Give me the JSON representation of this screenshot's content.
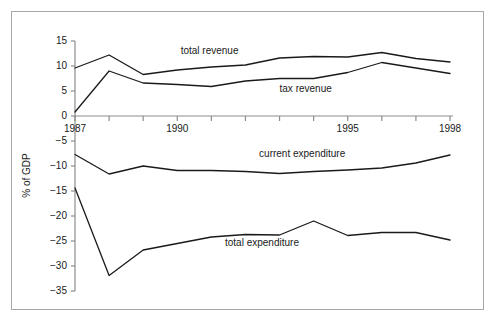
{
  "chart_data": {
    "type": "line",
    "title": "",
    "subtitle": "",
    "xlabel": "",
    "ylabel": "% of GDP",
    "x": [
      1987,
      1988,
      1989,
      1990,
      1991,
      1992,
      1993,
      1994,
      1995,
      1996,
      1997,
      1998
    ],
    "xlim": [
      1986.8,
      1998.2
    ],
    "ylim": [
      -35,
      15
    ],
    "xticks": [
      1987,
      1988,
      1989,
      1990,
      1991,
      1992,
      1993,
      1994,
      1995,
      1996,
      1997,
      1998
    ],
    "xtick_labels": [
      "1987",
      "",
      "",
      "1990",
      "",
      "",
      "",
      "",
      "1995",
      "",
      "",
      "1998"
    ],
    "yticks": [
      15,
      10,
      5,
      0,
      -5,
      -10,
      -15,
      -20,
      -25,
      -30,
      -35
    ],
    "ytick_labels": [
      "15",
      "10",
      "5",
      "0",
      "-5",
      "-10",
      "-15",
      "-20",
      "-25",
      "-30",
      "-35"
    ],
    "grid": false,
    "legend_position": "inline-annotations",
    "zero_line": true,
    "line_color": "#1a1a1a",
    "series": [
      {
        "name": "total revenue",
        "label": "total revenue",
        "values": [
          9.6,
          12.2,
          8.3,
          9.2,
          9.8,
          10.2,
          11.6,
          11.9,
          11.8,
          12.7,
          11.5,
          10.8
        ]
      },
      {
        "name": "tax revenue",
        "label": "tax revenue",
        "values": [
          0.8,
          9.0,
          6.6,
          6.3,
          5.9,
          7.0,
          7.5,
          7.5,
          8.7,
          10.7,
          9.6,
          8.5
        ]
      },
      {
        "name": "current expenditure",
        "label": "current expenditure",
        "values": [
          -7.7,
          -11.6,
          -10.0,
          -10.9,
          -10.9,
          -11.1,
          -11.5,
          -11.1,
          -10.8,
          -10.4,
          -9.4,
          -7.8
        ]
      },
      {
        "name": "total expenditure",
        "label": "total expenditure",
        "values": [
          -14.4,
          -31.9,
          -26.8,
          -25.5,
          -24.2,
          -23.7,
          -23.8,
          -21.0,
          -23.9,
          -23.3,
          -23.3,
          -24.8
        ]
      }
    ],
    "annotations": [
      {
        "text": "total revenue",
        "x": 1990.1,
        "y": 13.0
      },
      {
        "text": "tax revenue",
        "x": 1993.0,
        "y": 5.4
      },
      {
        "text": "current expenditure",
        "x": 1992.4,
        "y": -7.6
      },
      {
        "text": "total expenditure",
        "x": 1991.4,
        "y": -25.3
      }
    ]
  }
}
